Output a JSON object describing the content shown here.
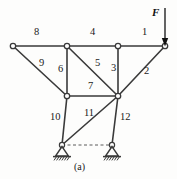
{
  "figure": {
    "caption": "(a)",
    "caption_x": 74,
    "caption_y": 163,
    "width": 177,
    "height": 179,
    "background_color": "#fdfdfc",
    "line_color": "#3a3a3a",
    "node_fill": "#ffffff",
    "text_color": "#1a1a1a"
  },
  "load": {
    "symbol": "F",
    "label_x": 152,
    "label_y": 8,
    "arrow_x": 165,
    "arrow_top_y": 8,
    "arrow_bottom_y": 46,
    "direction": "down"
  },
  "nodes": [
    {
      "id": "A",
      "name": "node-top-left",
      "x": 13,
      "y": 46
    },
    {
      "id": "B",
      "name": "node-top-upper-left",
      "x": 67,
      "y": 46
    },
    {
      "id": "C",
      "name": "node-top-mid-right",
      "x": 118,
      "y": 46
    },
    {
      "id": "D",
      "name": "node-top-right-load",
      "x": 165,
      "y": 46
    },
    {
      "id": "E",
      "name": "node-mid-left",
      "x": 67,
      "y": 96
    },
    {
      "id": "G",
      "name": "node-mid-junction",
      "x": 118,
      "y": 96
    },
    {
      "id": "H",
      "name": "node-support-left",
      "x": 62,
      "y": 145
    },
    {
      "id": "K",
      "name": "node-support-right",
      "x": 112,
      "y": 145
    }
  ],
  "members": [
    {
      "number": "1",
      "from": "C",
      "to": "D",
      "label_x": 142,
      "label_y": 32
    },
    {
      "number": "2",
      "from": "D",
      "to": "G",
      "label_x": 144,
      "label_y": 70
    },
    {
      "number": "3",
      "from": "C",
      "to": "G",
      "label_x": 111,
      "label_y": 68
    },
    {
      "number": "4",
      "from": "B",
      "to": "C",
      "label_x": 90,
      "label_y": 32
    },
    {
      "number": "5",
      "from": "B",
      "to": "G",
      "label_x": 95,
      "label_y": 62
    },
    {
      "number": "6",
      "from": "B",
      "to": "E",
      "label_x": 59,
      "label_y": 68
    },
    {
      "number": "7",
      "from": "E",
      "to": "G",
      "label_x": 90,
      "label_y": 85
    },
    {
      "number": "8",
      "from": "A",
      "to": "B",
      "label_x": 34,
      "label_y": 32
    },
    {
      "number": "9",
      "from": "A",
      "to": "E",
      "label_x": 39,
      "label_y": 62
    },
    {
      "number": "10",
      "from": "E",
      "to": "H",
      "label_x": 52,
      "label_y": 116
    },
    {
      "number": "11",
      "from": "H",
      "to": "G",
      "label_x": 86,
      "label_y": 112
    },
    {
      "number": "12",
      "from": "K",
      "to": "G",
      "label_x": 118,
      "label_y": 116
    }
  ],
  "supports": [
    {
      "name": "support-left",
      "type": "pin",
      "x": 62,
      "y": 145,
      "ground_y": 156
    },
    {
      "name": "support-right",
      "type": "pin",
      "x": 112,
      "y": 145,
      "ground_y": 156
    }
  ],
  "guides": [
    {
      "name": "support-baseline-dashed",
      "x1": 62,
      "y1": 145,
      "x2": 112,
      "y2": 145,
      "style": "dashed"
    }
  ]
}
